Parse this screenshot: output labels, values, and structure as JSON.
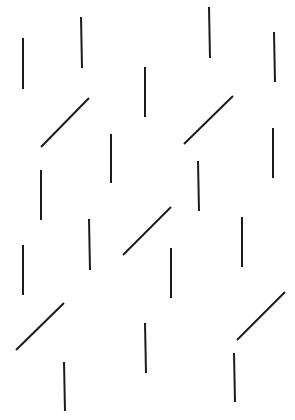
{
  "stimulus": {
    "width": 295,
    "height": 420,
    "background": "#ffffff",
    "stroke_color": "#1c1c1c",
    "stroke_width": 2,
    "segments": [
      {
        "id": 1,
        "orientation": "vertical",
        "x1": 23,
        "y1": 38,
        "x2": 23,
        "y2": 89
      },
      {
        "id": 2,
        "orientation": "vertical",
        "x1": 81,
        "y1": 17,
        "x2": 82,
        "y2": 68
      },
      {
        "id": 3,
        "orientation": "vertical",
        "x1": 145,
        "y1": 67,
        "x2": 145,
        "y2": 117
      },
      {
        "id": 4,
        "orientation": "vertical",
        "x1": 209,
        "y1": 7,
        "x2": 210,
        "y2": 58
      },
      {
        "id": 5,
        "orientation": "vertical",
        "x1": 274,
        "y1": 32,
        "x2": 275,
        "y2": 82
      },
      {
        "id": 6,
        "orientation": "diagonal",
        "x1": 41,
        "y1": 147,
        "x2": 89,
        "y2": 98
      },
      {
        "id": 7,
        "orientation": "vertical",
        "x1": 111,
        "y1": 134,
        "x2": 111,
        "y2": 183
      },
      {
        "id": 8,
        "orientation": "vertical",
        "x1": 41,
        "y1": 170,
        "x2": 41,
        "y2": 220
      },
      {
        "id": 9,
        "orientation": "diagonal",
        "x1": 184,
        "y1": 144,
        "x2": 233,
        "y2": 96
      },
      {
        "id": 10,
        "orientation": "vertical",
        "x1": 273,
        "y1": 128,
        "x2": 273,
        "y2": 178
      },
      {
        "id": 11,
        "orientation": "vertical",
        "x1": 198,
        "y1": 161,
        "x2": 199,
        "y2": 211
      },
      {
        "id": 12,
        "orientation": "vertical",
        "x1": 89,
        "y1": 219,
        "x2": 90,
        "y2": 270
      },
      {
        "id": 13,
        "orientation": "vertical",
        "x1": 23,
        "y1": 245,
        "x2": 23,
        "y2": 295
      },
      {
        "id": 14,
        "orientation": "diagonal",
        "x1": 123,
        "y1": 255,
        "x2": 171,
        "y2": 207
      },
      {
        "id": 15,
        "orientation": "vertical",
        "x1": 171,
        "y1": 248,
        "x2": 171,
        "y2": 298
      },
      {
        "id": 16,
        "orientation": "vertical",
        "x1": 242,
        "y1": 217,
        "x2": 242,
        "y2": 267
      },
      {
        "id": 17,
        "orientation": "diagonal",
        "x1": 16,
        "y1": 350,
        "x2": 64,
        "y2": 303
      },
      {
        "id": 18,
        "orientation": "vertical",
        "x1": 64,
        "y1": 362,
        "x2": 65,
        "y2": 411
      },
      {
        "id": 19,
        "orientation": "vertical",
        "x1": 145,
        "y1": 323,
        "x2": 146,
        "y2": 373
      },
      {
        "id": 20,
        "orientation": "diagonal",
        "x1": 237,
        "y1": 340,
        "x2": 285,
        "y2": 292
      },
      {
        "id": 21,
        "orientation": "vertical",
        "x1": 234,
        "y1": 353,
        "x2": 235,
        "y2": 402
      }
    ]
  }
}
